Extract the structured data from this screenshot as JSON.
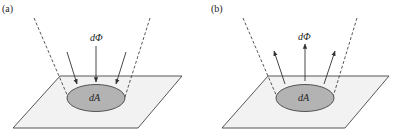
{
  "panels": [
    {
      "label": "(a)",
      "flux_label": "dΦ",
      "area_label": "dA",
      "arrow_direction": "incoming"
    },
    {
      "label": "(b)",
      "flux_label": "dΦ",
      "area_label": "dA",
      "arrow_direction": "outgoing"
    }
  ],
  "colors": {
    "plane_fill": "#f2f2f2",
    "area_fill": "#b3b3b3",
    "stroke": "#444444"
  }
}
